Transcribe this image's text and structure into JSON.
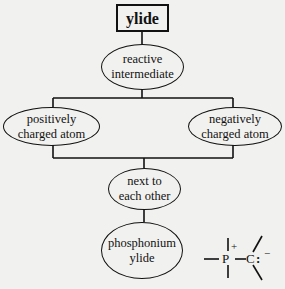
{
  "diagram": {
    "root": {
      "label": "ylide"
    },
    "nodes": {
      "reactive": {
        "line1": "reactive",
        "line2": "intermediate"
      },
      "positive": {
        "line1": "positively",
        "line2": "charged atom"
      },
      "negative": {
        "line1": "negatively",
        "line2": "charged atom"
      },
      "next": {
        "line1": "next to",
        "line2": "each other"
      },
      "phosphonium": {
        "line1": "phosphonium",
        "line2": "ylide"
      }
    },
    "structure": {
      "atom1": "P",
      "atom1_charge": "+",
      "atom2": "C",
      "lone_pair": ":",
      "atom2_charge": "−"
    }
  }
}
